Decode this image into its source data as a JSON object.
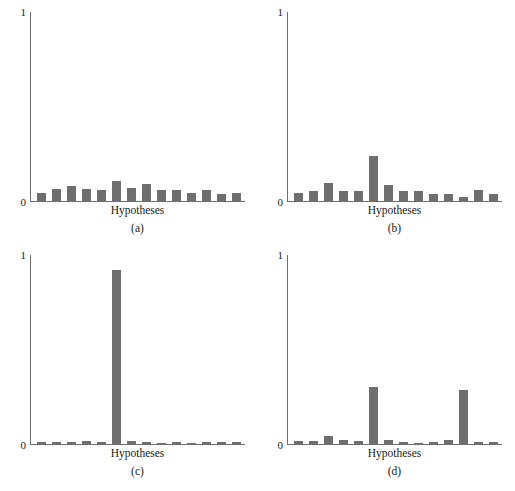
{
  "figure": {
    "axis_color": "#6f6f6f",
    "bar_color": "#6e6e6e",
    "background": "#ffffff",
    "shared_xlabel": "Hypotheses",
    "y_tick_top": "1",
    "y_tick_bottom": "0"
  },
  "panels": [
    {
      "caption": "(a)",
      "xlabel": "Hypotheses",
      "ytop": "1",
      "ybottom": "0"
    },
    {
      "caption": "(b)",
      "xlabel": "Hypotheses",
      "ytop": "1",
      "ybottom": "0"
    },
    {
      "caption": "(c)",
      "xlabel": "Hypotheses",
      "ytop": "1",
      "ybottom": "0"
    },
    {
      "caption": "(d)",
      "xlabel": "Hypotheses",
      "ytop": "1",
      "ybottom": "0"
    }
  ],
  "chart_data": [
    {
      "type": "bar",
      "title": "(a)",
      "xlabel": "Hypotheses",
      "ylabel": "",
      "ylim": [
        0,
        1
      ],
      "grid": false,
      "legend": "none",
      "categories": [
        "1",
        "2",
        "3",
        "4",
        "5",
        "6",
        "7",
        "8",
        "9",
        "10",
        "11",
        "12",
        "13",
        "14"
      ],
      "values": [
        0.045,
        0.065,
        0.08,
        0.065,
        0.06,
        0.105,
        0.07,
        0.09,
        0.06,
        0.058,
        0.04,
        0.058,
        0.038,
        0.04
      ]
    },
    {
      "type": "bar",
      "title": "(b)",
      "xlabel": "Hypotheses",
      "ylabel": "",
      "ylim": [
        0,
        1
      ],
      "grid": false,
      "legend": "none",
      "categories": [
        "1",
        "2",
        "3",
        "4",
        "5",
        "6",
        "7",
        "8",
        "9",
        "10",
        "11",
        "12",
        "13",
        "14"
      ],
      "values": [
        0.04,
        0.055,
        0.095,
        0.055,
        0.055,
        0.24,
        0.085,
        0.052,
        0.052,
        0.038,
        0.038,
        0.02,
        0.058,
        0.038
      ]
    },
    {
      "type": "bar",
      "title": "(c)",
      "xlabel": "Hypotheses",
      "ylabel": "",
      "ylim": [
        0,
        1
      ],
      "grid": false,
      "legend": "none",
      "categories": [
        "1",
        "2",
        "3",
        "4",
        "5",
        "6",
        "7",
        "8",
        "9",
        "10",
        "11",
        "12",
        "13",
        "14"
      ],
      "values": [
        0.013,
        0.012,
        0.013,
        0.016,
        0.012,
        0.92,
        0.016,
        0.011,
        0.008,
        0.012,
        0.008,
        0.01,
        0.01,
        0.012
      ]
    },
    {
      "type": "bar",
      "title": "(d)",
      "xlabel": "Hypotheses",
      "ylabel": "",
      "ylim": [
        0,
        1
      ],
      "grid": false,
      "legend": "none",
      "categories": [
        "1",
        "2",
        "3",
        "4",
        "5",
        "6",
        "7",
        "8",
        "9",
        "10",
        "11",
        "12",
        "13",
        "14"
      ],
      "values": [
        0.018,
        0.015,
        0.042,
        0.02,
        0.014,
        0.3,
        0.02,
        0.012,
        0.008,
        0.013,
        0.02,
        0.285,
        0.013,
        0.013
      ]
    }
  ]
}
